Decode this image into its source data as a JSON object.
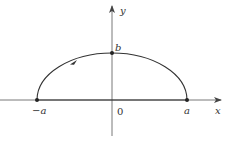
{
  "diagram": {
    "type": "coordinate-plot",
    "axes": {
      "x_label": "x",
      "y_label": "y",
      "origin_label": "0"
    },
    "points": [
      {
        "id": "neg-a",
        "label": "−a",
        "coords": [
          -1,
          0
        ]
      },
      {
        "id": "b",
        "label": "b",
        "coords": [
          0,
          1
        ]
      },
      {
        "id": "a",
        "label": "a",
        "coords": [
          1,
          0
        ]
      }
    ],
    "curve": {
      "shape": "upper-half-ellipse",
      "direction_arrow": "toward upper-left along arc (counterclockwise)"
    },
    "colors": {
      "stroke": "#333333",
      "axis": "#555555",
      "background": "#ffffff"
    }
  }
}
